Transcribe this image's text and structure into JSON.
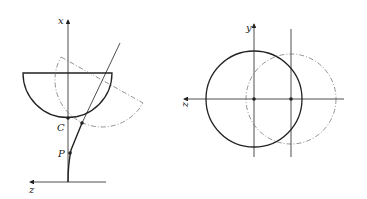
{
  "left_diagram": {
    "axis_vertical_label": "x",
    "axis_horizontal_label": "z",
    "point_c_label": "C",
    "point_p_label": "P"
  },
  "right_diagram": {
    "axis_vertical_label": "y",
    "axis_horizontal_label": "z"
  },
  "colors": {
    "stroke": "#222222",
    "dashed": "#666666",
    "background": "#ffffff"
  }
}
